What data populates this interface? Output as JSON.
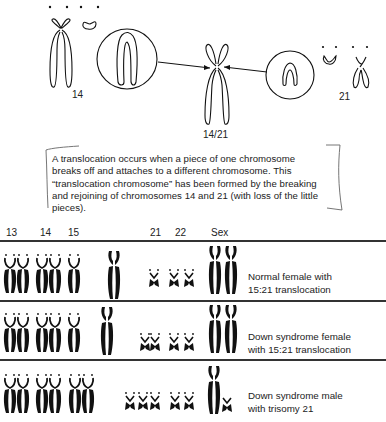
{
  "diagram": {
    "title_area": {
      "chromosome_labels": {
        "left": "14",
        "center": "14/21",
        "right": "21"
      }
    },
    "caption": "A translocation occurs when a piece of one chromosome breaks off and attaches to a different chromosome. This “translocation chromosome” has been formed by the breaking and rejoining of chromosomes 14 and 21 (with loss of the little pieces).",
    "karyotype": {
      "column_headers": [
        "13",
        "14",
        "15",
        "21",
        "22",
        "Sex"
      ],
      "rows": [
        {
          "label_line1": "Normal female with",
          "label_line2": "15:21 translocation"
        },
        {
          "label_line1": "Down syndrome female",
          "label_line2": "with 15:21 translocation"
        },
        {
          "label_line1": "Down syndrome male",
          "label_line2": "with trisomy 21"
        }
      ]
    },
    "colors": {
      "ink": "#1a1a1a",
      "background": "#ffffff"
    }
  }
}
